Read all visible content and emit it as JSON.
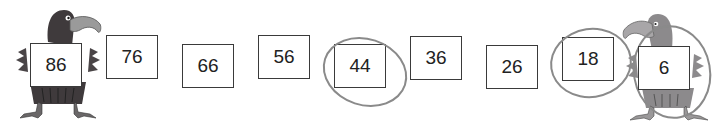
{
  "sequence": {
    "boxes": [
      {
        "value": "86",
        "left": 30,
        "top": 43
      },
      {
        "value": "76",
        "left": 106,
        "top": 35
      },
      {
        "value": "66",
        "left": 182,
        "top": 44
      },
      {
        "value": "56",
        "left": 258,
        "top": 35
      },
      {
        "value": "44",
        "left": 334,
        "top": 44
      },
      {
        "value": "36",
        "left": 410,
        "top": 36
      },
      {
        "value": "26",
        "left": 486,
        "top": 45
      },
      {
        "value": "18",
        "left": 562,
        "top": 37
      },
      {
        "value": "6",
        "left": 638,
        "top": 46
      }
    ],
    "circled_values": [
      "44",
      "18"
    ]
  },
  "characters": {
    "left_bird": "vulture-facing-right-dark",
    "right_bird": "vulture-facing-left-light"
  },
  "colors": {
    "box_border": "#3a3a3a",
    "circle_stroke": "#8a8a8a",
    "bird_dark": "#3f3a3c",
    "bird_light": "#8c8a8c",
    "beak": "#9a9a9a"
  }
}
